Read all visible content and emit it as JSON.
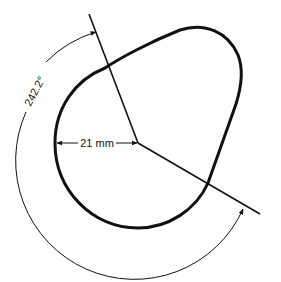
{
  "diagram": {
    "type": "cam-profile",
    "colors": {
      "stroke": "#111111",
      "background": "#ffffff"
    },
    "labels": {
      "base_radius": "21 mm",
      "duration_angle": "242.2°"
    },
    "elements": {
      "cam_outline": "cam lobe profile",
      "opening_line": "radial line (upper)",
      "closing_line": "radial line (lower)",
      "angle_arc": "dimension arc with arrows",
      "radius_dimension": "base circle radius dimension"
    }
  }
}
